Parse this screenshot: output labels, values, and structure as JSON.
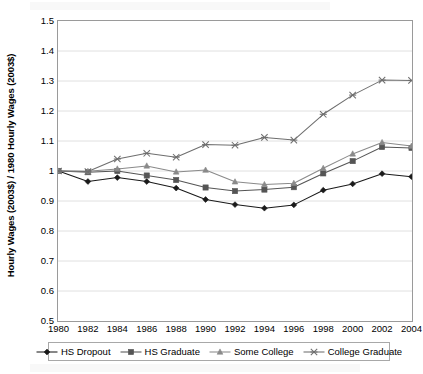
{
  "chart_data": {
    "type": "line",
    "title": "",
    "subtitle": "",
    "xlabel": "",
    "ylabel": "Hourly Wages (2003$) / 1980 Hourly Wages (2003$)",
    "x": [
      1980,
      1982,
      1984,
      1986,
      1988,
      1990,
      1992,
      1994,
      1996,
      1998,
      2000,
      2002,
      2004
    ],
    "xtick_labels": [
      "1980",
      "1982",
      "1984",
      "1986",
      "1988",
      "1990",
      "1992",
      "1994",
      "1996",
      "1998",
      "2000",
      "2002",
      "2004"
    ],
    "ytick_labels": [
      "1.5",
      "1.4",
      "1.3",
      "1.2",
      "1.1",
      "1",
      "0.9",
      "0.8",
      "0.7",
      "0.6",
      "0.5"
    ],
    "ytick_values": [
      1.5,
      1.4,
      1.3,
      1.2,
      1.1,
      1.0,
      0.9,
      0.8,
      0.7,
      0.6,
      0.5
    ],
    "ylim": [
      0.5,
      1.5
    ],
    "grid": "horizontal",
    "legend_position": "bottom",
    "series": [
      {
        "name": "HS Dropout",
        "marker": "diamond",
        "color": "#1a1a1a",
        "values": [
          1.0,
          0.965,
          0.978,
          0.965,
          0.943,
          0.905,
          0.888,
          0.876,
          0.887,
          0.936,
          0.957,
          0.991,
          0.981
        ]
      },
      {
        "name": "HS Graduate",
        "marker": "square",
        "color": "#555555",
        "values": [
          1.0,
          0.996,
          1.0,
          0.985,
          0.97,
          0.945,
          0.933,
          0.938,
          0.946,
          0.992,
          1.033,
          1.08,
          1.077
        ]
      },
      {
        "name": "Some College",
        "marker": "triangle",
        "color": "#8a8a8a",
        "values": [
          1.0,
          0.999,
          1.007,
          1.017,
          0.997,
          1.003,
          0.964,
          0.955,
          0.959,
          1.009,
          1.057,
          1.095,
          1.083
        ]
      },
      {
        "name": "College Graduate",
        "marker": "x",
        "color": "#6e6e6e",
        "values": [
          1.0,
          0.998,
          1.04,
          1.059,
          1.046,
          1.088,
          1.086,
          1.112,
          1.103,
          1.189,
          1.253,
          1.303,
          1.302
        ]
      }
    ]
  },
  "legend": {
    "items": [
      {
        "label": "HS Dropout"
      },
      {
        "label": "HS Graduate"
      },
      {
        "label": "Some College"
      },
      {
        "label": "College Graduate"
      }
    ]
  }
}
